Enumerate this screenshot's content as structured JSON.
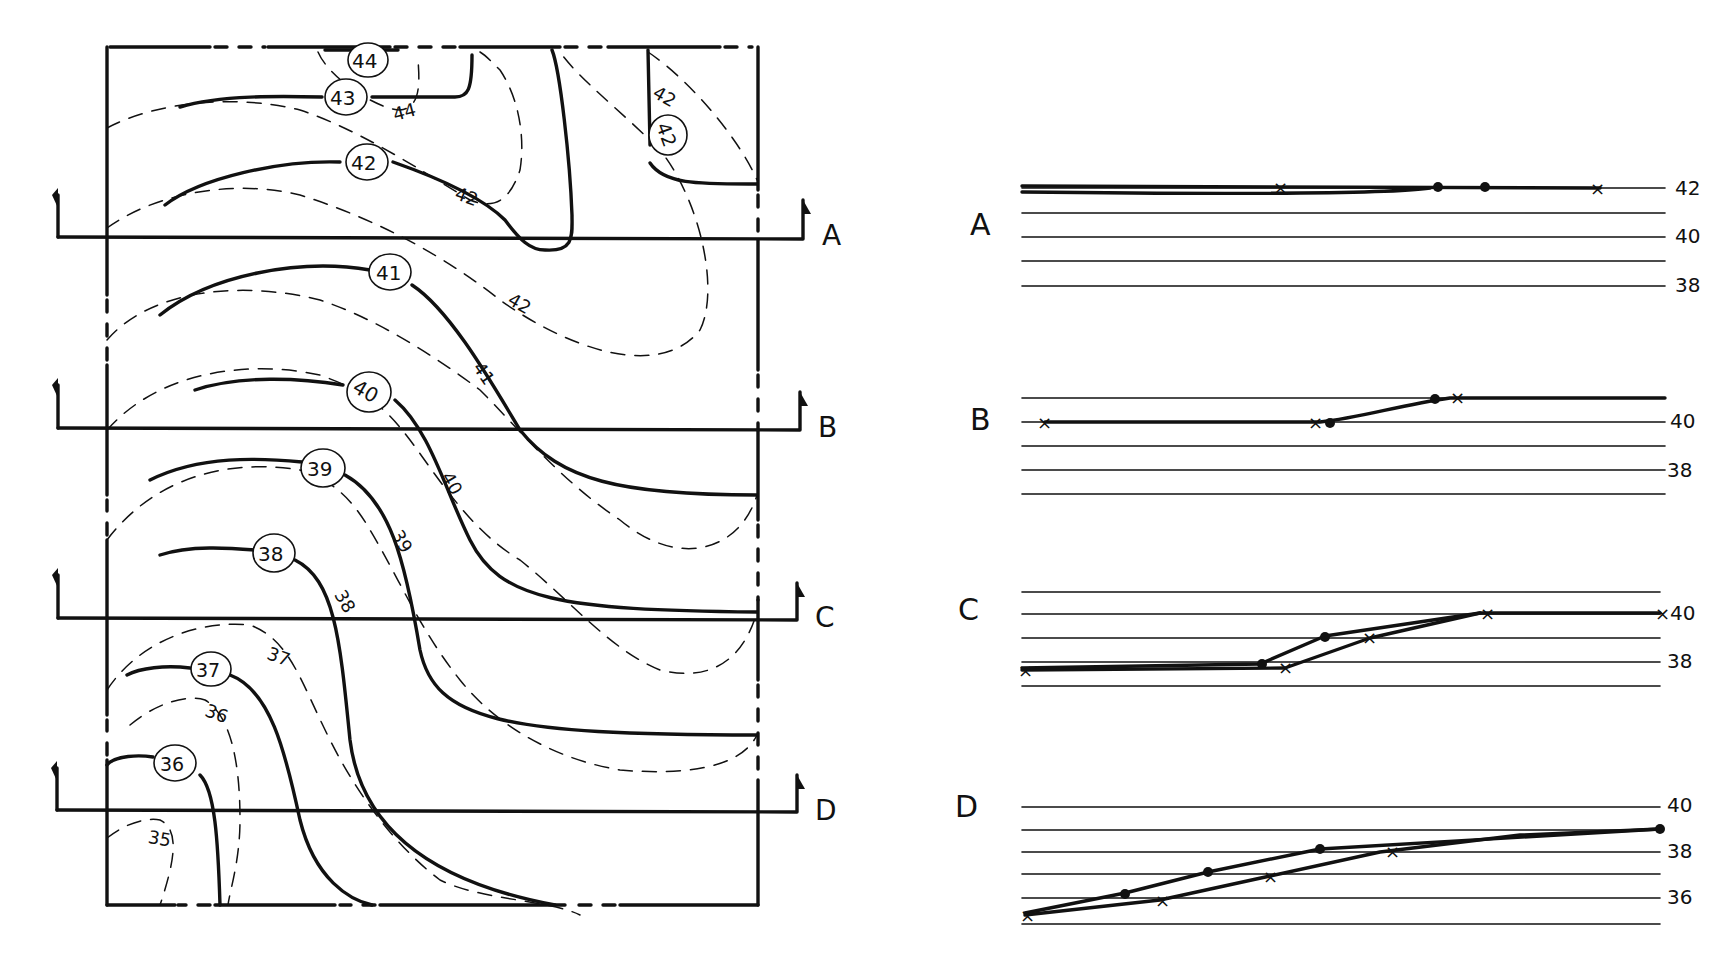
{
  "plan": {
    "existing_contour_labels": [
      "44",
      "43",
      "42",
      "42",
      "41",
      "40",
      "39",
      "38",
      "37",
      "36",
      "35"
    ],
    "proposed_contour_labels": [
      "44",
      "43",
      "42",
      "42",
      "41",
      "40",
      "39",
      "38",
      "37",
      "36"
    ],
    "section_cuts": [
      {
        "id": "A",
        "label": "A"
      },
      {
        "id": "B",
        "label": "B"
      },
      {
        "id": "C",
        "label": "C"
      },
      {
        "id": "D",
        "label": "D"
      }
    ]
  },
  "sections": [
    {
      "id": "A",
      "label": "A",
      "elev_labels": [
        "42",
        "40",
        "38"
      ]
    },
    {
      "id": "B",
      "label": "B",
      "elev_labels": [
        "40",
        "38"
      ]
    },
    {
      "id": "C",
      "label": "C",
      "elev_labels": [
        "40",
        "38"
      ]
    },
    {
      "id": "D",
      "label": "D",
      "elev_labels": [
        "40",
        "38",
        "36"
      ]
    }
  ],
  "legend": {
    "existing_contour": "dashed line",
    "proposed_contour": "solid line",
    "existing_grade_marker": "x",
    "proposed_grade_marker": "dot"
  },
  "colors": {
    "ink": "#111111",
    "paper": "#ffffff"
  }
}
